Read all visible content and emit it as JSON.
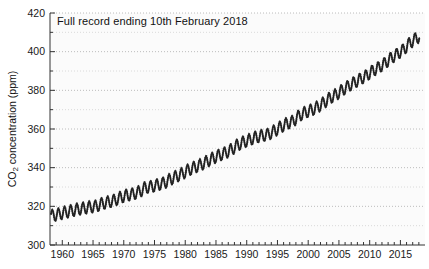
{
  "figure": {
    "title_label": "Full record ending 10th February 2018",
    "ylabel_parts": {
      "prefix": "CO",
      "sub": "2",
      "suffix": " concentration (ppm)"
    }
  },
  "colors": {
    "axis": "#333333",
    "tick_label": "#1a1a1a",
    "grid_major": "#bcbcbc",
    "grid_minor": "#dadada",
    "series_line": "#1c1c1c",
    "plot_background": "#fbfbfb",
    "figure_background": "#ffffff"
  },
  "chart_data": {
    "type": "line",
    "title": "Full record ending 10th February 2018",
    "xlabel": "",
    "ylabel": "CO2 concentration (ppm)",
    "xlim": [
      1958,
      2019
    ],
    "ylim": [
      300,
      420
    ],
    "x_ticks_major": [
      1960,
      1965,
      1970,
      1975,
      1980,
      1985,
      1990,
      1995,
      2000,
      2005,
      2010,
      2015
    ],
    "x_tick_minor_step_years": 1,
    "y_ticks_major": [
      300,
      320,
      340,
      360,
      380,
      400,
      420
    ],
    "y_tick_minor_step_ppm": 10,
    "grid": "horizontal dotted lines every 10 ppm, no vertical gridlines",
    "legend": "none",
    "series": [
      {
        "name": "Atmospheric CO2 (Mauna Loa full record, seasonal cycle visible)",
        "start_year_decimal": 1958.17,
        "end_year_decimal": 2018.12,
        "annual_mean_years": [
          1958,
          1959,
          1960,
          1961,
          1962,
          1963,
          1964,
          1965,
          1966,
          1967,
          1968,
          1969,
          1970,
          1971,
          1972,
          1973,
          1974,
          1975,
          1976,
          1977,
          1978,
          1979,
          1980,
          1981,
          1982,
          1983,
          1984,
          1985,
          1986,
          1987,
          1988,
          1989,
          1990,
          1991,
          1992,
          1993,
          1994,
          1995,
          1996,
          1997,
          1998,
          1999,
          2000,
          2001,
          2002,
          2003,
          2004,
          2005,
          2006,
          2007,
          2008,
          2009,
          2010,
          2011,
          2012,
          2013,
          2014,
          2015,
          2016,
          2017,
          2018
        ],
        "annual_mean_ppm": [
          315.3,
          315.97,
          316.91,
          317.64,
          318.45,
          318.99,
          319.62,
          320.04,
          321.37,
          322.18,
          323.05,
          324.62,
          325.68,
          326.32,
          327.46,
          329.68,
          330.19,
          331.12,
          332.03,
          333.84,
          335.41,
          336.84,
          338.76,
          340.12,
          341.48,
          343.15,
          344.85,
          346.35,
          347.61,
          349.31,
          351.69,
          353.2,
          354.45,
          355.7,
          356.54,
          357.21,
          358.96,
          360.97,
          362.74,
          363.88,
          366.84,
          368.54,
          369.71,
          371.32,
          373.45,
          375.98,
          377.7,
          379.98,
          382.09,
          384.02,
          385.83,
          387.64,
          390.1,
          391.85,
          394.06,
          396.74,
          398.81,
          401.01,
          404.41,
          406.76,
          408.8
        ],
        "seasonal_amplitude_ppm": 3.1,
        "seasonal_phase_rad": -0.75
      }
    ]
  }
}
